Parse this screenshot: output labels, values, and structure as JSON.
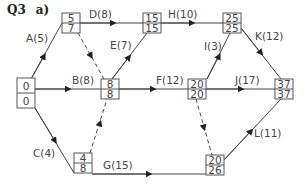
{
  "title": {
    "question": "Q3",
    "part": "a)"
  },
  "nodes": [
    {
      "id": "n0",
      "early": "0",
      "late": "0",
      "x": 17,
      "y": 88
    },
    {
      "id": "n1",
      "early": "5",
      "late": "7",
      "x": 62,
      "y": 13
    },
    {
      "id": "n2",
      "early": "15",
      "late": "15",
      "x": 143,
      "y": 13
    },
    {
      "id": "n3",
      "early": "8",
      "late": "8",
      "x": 101,
      "y": 79
    },
    {
      "id": "n4",
      "early": "4",
      "late": "8",
      "x": 74,
      "y": 153
    },
    {
      "id": "n5",
      "early": "25",
      "late": "25",
      "x": 223,
      "y": 13
    },
    {
      "id": "n6",
      "early": "20",
      "late": "20",
      "x": 188,
      "y": 79
    },
    {
      "id": "n7",
      "early": "37",
      "late": "37",
      "x": 275,
      "y": 79
    },
    {
      "id": "n8",
      "early": "20",
      "late": "26",
      "x": 206,
      "y": 155
    }
  ],
  "activities": [
    {
      "label": "A(5)",
      "from": "n0",
      "to": "n1"
    },
    {
      "label": "B(8)",
      "from": "n0",
      "to": "n3"
    },
    {
      "label": "C(4)",
      "from": "n0",
      "to": "n4"
    },
    {
      "label": "D(8)",
      "from": "n1",
      "to": "n2"
    },
    {
      "label": "E(7)",
      "from": "n3",
      "to": "n2"
    },
    {
      "label": "F(12)",
      "from": "n3",
      "to": "n6"
    },
    {
      "label": "G(15)",
      "from": "n4",
      "to": "n8"
    },
    {
      "label": "H(10)",
      "from": "n2",
      "to": "n5"
    },
    {
      "label": "I(3)",
      "from": "n6",
      "to": "n5"
    },
    {
      "label": "J(17)",
      "from": "n6",
      "to": "n7"
    },
    {
      "label": "K(12)",
      "from": "n5",
      "to": "n7"
    },
    {
      "label": "L(11)",
      "from": "n8",
      "to": "n7"
    }
  ],
  "dummies": [
    {
      "from": "n1",
      "to": "n3"
    },
    {
      "from": "n4",
      "to": "n3"
    },
    {
      "from": "n6",
      "to": "n8"
    }
  ]
}
